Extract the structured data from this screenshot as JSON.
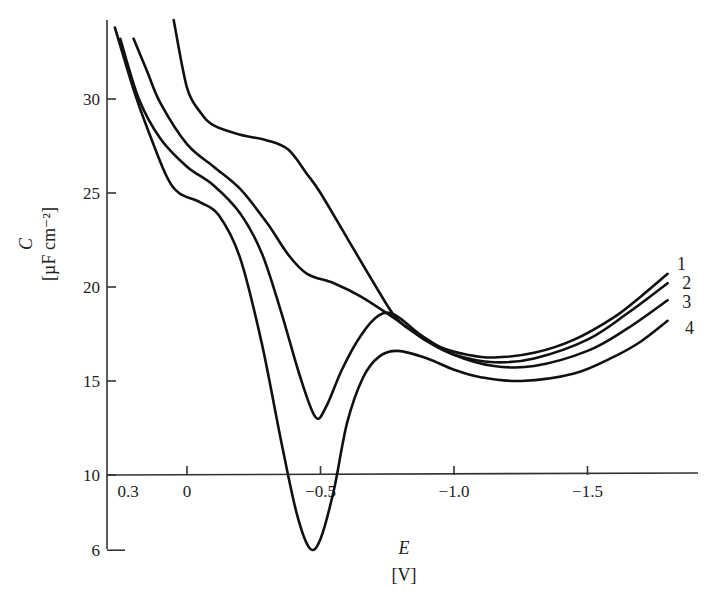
{
  "chart_data": {
    "type": "line",
    "title": "",
    "xlabel": "E",
    "xlabel_unit": "[V]",
    "ylabel": "C",
    "ylabel_unit": "[µF cm⁻²]",
    "xlim": [
      0.3,
      -1.8
    ],
    "ylim": [
      6,
      34
    ],
    "grid": false,
    "legend_position": "inline-right",
    "x_axis_crosses_y_at": 10,
    "x_ticks": [
      {
        "value": 0.3,
        "label": "0.3",
        "tick": false
      },
      {
        "value": 0,
        "label": "0"
      },
      {
        "value": -0.5,
        "label": "−0.5"
      },
      {
        "value": -1.0,
        "label": "−1.0"
      },
      {
        "value": -1.5,
        "label": "−1.5"
      }
    ],
    "y_ticks": [
      {
        "value": 6,
        "label": "6"
      },
      {
        "value": 10,
        "label": "10"
      },
      {
        "value": 15,
        "label": "15"
      },
      {
        "value": 20,
        "label": "20"
      },
      {
        "value": 25,
        "label": "25"
      },
      {
        "value": 30,
        "label": "30"
      }
    ],
    "series": [
      {
        "name": "1",
        "points": [
          [
            0.05,
            34.2
          ],
          [
            0.0,
            30.6
          ],
          [
            -0.05,
            29.3
          ],
          [
            -0.1,
            28.6
          ],
          [
            -0.2,
            28.1
          ],
          [
            -0.3,
            27.8
          ],
          [
            -0.38,
            27.3
          ],
          [
            -0.45,
            26.0
          ],
          [
            -0.5,
            25.0
          ],
          [
            -0.6,
            22.6
          ],
          [
            -0.7,
            20.2
          ],
          [
            -0.78,
            18.4
          ],
          [
            -0.85,
            17.6
          ],
          [
            -0.95,
            16.8
          ],
          [
            -1.05,
            16.4
          ],
          [
            -1.15,
            16.25
          ],
          [
            -1.3,
            16.5
          ],
          [
            -1.45,
            17.2
          ],
          [
            -1.6,
            18.4
          ],
          [
            -1.7,
            19.5
          ],
          [
            -1.8,
            20.7
          ]
        ]
      },
      {
        "name": "2",
        "points": [
          [
            0.2,
            33.2
          ],
          [
            0.15,
            31.5
          ],
          [
            0.1,
            29.8
          ],
          [
            0.0,
            27.6
          ],
          [
            -0.1,
            26.4
          ],
          [
            -0.2,
            25.2
          ],
          [
            -0.3,
            23.4
          ],
          [
            -0.38,
            21.7
          ],
          [
            -0.45,
            20.7
          ],
          [
            -0.55,
            20.2
          ],
          [
            -0.65,
            19.5
          ],
          [
            -0.78,
            18.3
          ],
          [
            -0.9,
            17.1
          ],
          [
            -1.0,
            16.4
          ],
          [
            -1.15,
            16.0
          ],
          [
            -1.3,
            16.2
          ],
          [
            -1.5,
            17.2
          ],
          [
            -1.65,
            18.6
          ],
          [
            -1.8,
            20.2
          ]
        ]
      },
      {
        "name": "3",
        "points": [
          [
            0.25,
            33.2
          ],
          [
            0.18,
            30.0
          ],
          [
            0.1,
            27.9
          ],
          [
            0.0,
            26.4
          ],
          [
            -0.1,
            25.4
          ],
          [
            -0.2,
            23.9
          ],
          [
            -0.28,
            21.8
          ],
          [
            -0.35,
            18.8
          ],
          [
            -0.42,
            15.4
          ],
          [
            -0.48,
            13.1
          ],
          [
            -0.52,
            13.6
          ],
          [
            -0.58,
            15.6
          ],
          [
            -0.65,
            17.4
          ],
          [
            -0.72,
            18.5
          ],
          [
            -0.78,
            18.5
          ],
          [
            -0.88,
            17.4
          ],
          [
            -1.0,
            16.4
          ],
          [
            -1.15,
            15.8
          ],
          [
            -1.3,
            15.8
          ],
          [
            -1.5,
            16.6
          ],
          [
            -1.65,
            17.8
          ],
          [
            -1.8,
            19.3
          ]
        ]
      },
      {
        "name": "4",
        "points": [
          [
            0.27,
            33.8
          ],
          [
            0.2,
            30.5
          ],
          [
            0.15,
            28.5
          ],
          [
            0.08,
            26.0
          ],
          [
            0.03,
            25.0
          ],
          [
            -0.05,
            24.5
          ],
          [
            -0.12,
            23.8
          ],
          [
            -0.2,
            21.5
          ],
          [
            -0.28,
            17.0
          ],
          [
            -0.35,
            12.0
          ],
          [
            -0.41,
            8.0
          ],
          [
            -0.46,
            6.1
          ],
          [
            -0.5,
            6.6
          ],
          [
            -0.55,
            9.2
          ],
          [
            -0.6,
            12.8
          ],
          [
            -0.66,
            15.2
          ],
          [
            -0.72,
            16.3
          ],
          [
            -0.79,
            16.6
          ],
          [
            -0.9,
            16.2
          ],
          [
            -1.0,
            15.6
          ],
          [
            -1.1,
            15.2
          ],
          [
            -1.25,
            15.0
          ],
          [
            -1.45,
            15.4
          ],
          [
            -1.6,
            16.3
          ],
          [
            -1.7,
            17.1
          ],
          [
            -1.8,
            18.2
          ]
        ]
      }
    ],
    "series_labels": [
      {
        "name": "1",
        "x": -1.82,
        "y": 21.2
      },
      {
        "name": "2",
        "x": -1.84,
        "y": 20.2
      },
      {
        "name": "3",
        "x": -1.84,
        "y": 19.2
      },
      {
        "name": "4",
        "x": -1.85,
        "y": 17.8
      }
    ]
  }
}
